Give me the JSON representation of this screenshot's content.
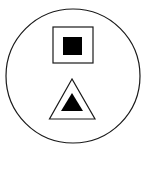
{
  "figure": {
    "colors": {
      "background": "#ffffff",
      "stroke": "#1a1a1a",
      "fill": "#000000"
    },
    "elements": [
      {
        "name": "outer-circle",
        "shape": "circle"
      },
      {
        "name": "square-symbol",
        "shape": "square outline with filled square"
      },
      {
        "name": "triangle-symbol",
        "shape": "triangle outline with filled triangle"
      }
    ]
  }
}
